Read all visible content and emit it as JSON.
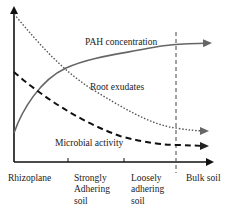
{
  "diagram": {
    "curves": [
      {
        "id": "pah",
        "label": "PAH concentration",
        "style": "solid",
        "color": "#666666",
        "trend": "increasing then plateau"
      },
      {
        "id": "root",
        "label": "Root exudates",
        "style": "dotted",
        "color": "#555555",
        "trend": "decreasing"
      },
      {
        "id": "microbial",
        "label": "Microbial activity",
        "style": "dashed",
        "color": "#111111",
        "trend": "decreasing"
      }
    ],
    "x_axis": {
      "zones": [
        {
          "lines": [
            "Rhizoplane"
          ]
        },
        {
          "lines": [
            "Strongly",
            "Adhering",
            "soil"
          ]
        },
        {
          "lines": [
            "Loosely",
            "adhering",
            "soil"
          ]
        },
        {
          "lines": [
            "Bulk soil"
          ]
        }
      ]
    },
    "colors": {
      "axis": "#111111",
      "text": "#222222",
      "divider": "#444444"
    }
  }
}
